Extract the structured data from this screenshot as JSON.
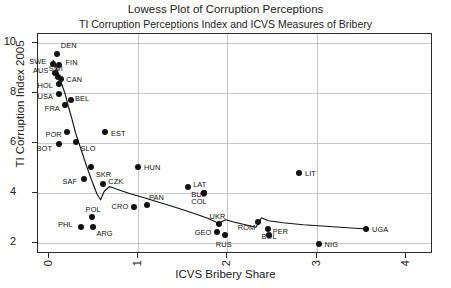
{
  "chart_data": {
    "type": "scatter",
    "title": "Lowess Plot of Corruption Perceptions",
    "subtitle": "TI Corruption Perceptions Index and ICVS Measures of Bribery",
    "xlabel": "ICVS Bribery Share",
    "ylabel": "TI Corruption Index 2005",
    "xlim": [
      -0.12,
      4.3
    ],
    "ylim": [
      1.55,
      10.35
    ],
    "xticks": [
      0,
      1,
      2,
      3,
      4
    ],
    "xticklabels": [
      "0",
      "1",
      "2",
      "3",
      "4"
    ],
    "yticks": [
      2,
      4,
      6,
      8,
      10
    ],
    "yticklabels": [
      "2",
      "4",
      "6",
      "8",
      "10"
    ],
    "grid": "both",
    "legend": "none",
    "points": [
      {
        "label": "DEN",
        "x": 0.09,
        "y": 9.55,
        "lx": 4,
        "ly": -9
      },
      {
        "label": "SWE",
        "x": 0.05,
        "y": 9.15,
        "lx": -24,
        "ly": -3
      },
      {
        "label": "FIN",
        "x": 0.12,
        "y": 9.1,
        "lx": 6,
        "ly": -3
      },
      {
        "label": "AUS",
        "x": 0.07,
        "y": 8.8,
        "lx": -22,
        "ly": -3
      },
      {
        "label": "CAN",
        "x": 0.14,
        "y": 8.55,
        "lx": 5,
        "ly": 0
      },
      {
        "label": "SWI",
        "x": 0.1,
        "y": 8.65,
        "lx": -9,
        "ly": -9
      },
      {
        "label": "HOL",
        "x": 0.11,
        "y": 8.35,
        "lx": -21,
        "ly": 1
      },
      {
        "label": "USA",
        "x": 0.12,
        "y": 7.95,
        "lx": -22,
        "ly": 2
      },
      {
        "label": "BEL",
        "x": 0.25,
        "y": 7.7,
        "lx": 4,
        "ly": -2
      },
      {
        "label": "FRA",
        "x": 0.18,
        "y": 7.5,
        "lx": -20,
        "ly": 3
      },
      {
        "label": "POR",
        "x": 0.21,
        "y": 6.45,
        "lx": -22,
        "ly": 2
      },
      {
        "label": "EST",
        "x": 0.63,
        "y": 6.45,
        "lx": 6,
        "ly": 1
      },
      {
        "label": "BOT",
        "x": 0.11,
        "y": 5.95,
        "lx": -22,
        "ly": 4
      },
      {
        "label": "SLO",
        "x": 0.3,
        "y": 6.05,
        "lx": 5,
        "ly": 6
      },
      {
        "label": "SKR",
        "x": 0.47,
        "y": 5.05,
        "lx": 5,
        "ly": 7
      },
      {
        "label": "SAF",
        "x": 0.4,
        "y": 4.55,
        "lx": -22,
        "ly": 2
      },
      {
        "label": "CZK",
        "x": 0.61,
        "y": 4.35,
        "lx": 5,
        "ly": -3
      },
      {
        "label": "HUN",
        "x": 1.0,
        "y": 5.05,
        "lx": 6,
        "ly": 0
      },
      {
        "label": "LAT",
        "x": 1.56,
        "y": 4.25,
        "lx": 5,
        "ly": -3
      },
      {
        "label": "BUL",
        "x": 1.74,
        "y": 4.0,
        "lx": -13,
        "ly": 1
      },
      {
        "label": "COL",
        "x": 1.74,
        "y": 4.0,
        "lx": -13,
        "ly": 8
      },
      {
        "label": "LIT",
        "x": 2.8,
        "y": 4.8,
        "lx": 6,
        "ly": 0
      },
      {
        "label": "CRO",
        "x": 0.95,
        "y": 3.45,
        "lx": -22,
        "ly": -1
      },
      {
        "label": "PAN",
        "x": 1.1,
        "y": 3.5,
        "lx": 2,
        "ly": -8
      },
      {
        "label": "POL",
        "x": 0.48,
        "y": 3.05,
        "lx": -6,
        "ly": -8
      },
      {
        "label": "PHL",
        "x": 0.36,
        "y": 2.65,
        "lx": -23,
        "ly": -3
      },
      {
        "label": "ARG",
        "x": 0.5,
        "y": 2.65,
        "lx": 3,
        "ly": 6
      },
      {
        "label": "UKR",
        "x": 1.9,
        "y": 2.75,
        "lx": -9,
        "ly": -8
      },
      {
        "label": "GEO",
        "x": 1.88,
        "y": 2.45,
        "lx": -22,
        "ly": 0
      },
      {
        "label": "RUS",
        "x": 1.97,
        "y": 2.3,
        "lx": -9,
        "ly": 9
      },
      {
        "label": "ROM",
        "x": 2.34,
        "y": 2.85,
        "lx": -20,
        "ly": 5
      },
      {
        "label": "PER",
        "x": 2.45,
        "y": 2.55,
        "lx": 5,
        "ly": 2
      },
      {
        "label": "BOL",
        "x": 2.46,
        "y": 2.3,
        "lx": -7,
        "ly": 1
      },
      {
        "label": "NIG",
        "x": 3.02,
        "y": 1.95,
        "lx": 6,
        "ly": 0
      },
      {
        "label": "UGA",
        "x": 3.55,
        "y": 2.55,
        "lx": 6,
        "ly": 0
      }
    ],
    "lowess_line": [
      {
        "x": 0.05,
        "y": 9.3
      },
      {
        "x": 0.1,
        "y": 8.85
      },
      {
        "x": 0.14,
        "y": 8.4
      },
      {
        "x": 0.18,
        "y": 8.0
      },
      {
        "x": 0.22,
        "y": 7.45
      },
      {
        "x": 0.26,
        "y": 6.95
      },
      {
        "x": 0.3,
        "y": 6.4
      },
      {
        "x": 0.36,
        "y": 5.75
      },
      {
        "x": 0.42,
        "y": 5.1
      },
      {
        "x": 0.48,
        "y": 4.5
      },
      {
        "x": 0.54,
        "y": 3.95
      },
      {
        "x": 0.58,
        "y": 3.72
      },
      {
        "x": 0.62,
        "y": 4.05
      },
      {
        "x": 0.68,
        "y": 4.25
      },
      {
        "x": 0.78,
        "y": 4.12
      },
      {
        "x": 0.92,
        "y": 3.95
      },
      {
        "x": 1.05,
        "y": 3.82
      },
      {
        "x": 1.25,
        "y": 3.6
      },
      {
        "x": 1.45,
        "y": 3.38
      },
      {
        "x": 1.62,
        "y": 3.18
      },
      {
        "x": 1.78,
        "y": 2.98
      },
      {
        "x": 1.9,
        "y": 2.78
      },
      {
        "x": 1.98,
        "y": 2.92
      },
      {
        "x": 2.08,
        "y": 2.82
      },
      {
        "x": 2.2,
        "y": 2.72
      },
      {
        "x": 2.32,
        "y": 2.62
      },
      {
        "x": 2.38,
        "y": 3.0
      },
      {
        "x": 2.46,
        "y": 2.88
      },
      {
        "x": 2.62,
        "y": 2.8
      },
      {
        "x": 2.85,
        "y": 2.72
      },
      {
        "x": 3.1,
        "y": 2.66
      },
      {
        "x": 3.55,
        "y": 2.55
      }
    ]
  }
}
